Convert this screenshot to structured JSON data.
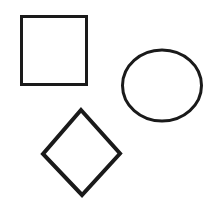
{
  "canvas": {
    "width": 211,
    "height": 200,
    "background_color": "#ffffff",
    "ink_color": "#1a1a1a",
    "description": "Three hand-drawn black outline geometric shapes on a plain white background: a square, an ellipse, and a diamond.",
    "shape_count": 3
  },
  "shapes": [
    {
      "name": "square",
      "label": "Square",
      "fill": "none",
      "stroke_color": "#1a1a1a",
      "stroke_width": 3,
      "position": "top-left",
      "points": "21.5,16.5 86.5,16.5 86.5,84.5 21.5,84.5",
      "bounds": {
        "x": 20,
        "y": 15,
        "width": 68,
        "height": 71
      }
    },
    {
      "name": "ellipse",
      "label": "Ellipse",
      "fill": "none",
      "stroke_color": "#1a1a1a",
      "stroke_width": 3,
      "position": "middle-right",
      "center_x": 162,
      "center_y": 85.5,
      "radius_x": 39.5,
      "radius_y": 35.5,
      "bounds": {
        "x": 121,
        "y": 49,
        "width": 82,
        "height": 73
      }
    },
    {
      "name": "diamond",
      "label": "Diamond",
      "fill": "none",
      "stroke_color": "#1a1a1a",
      "stroke_width": 4,
      "position": "bottom-left",
      "points": "81,110 120,153.5 82,195 43,154",
      "bounds": {
        "x": 41,
        "y": 108,
        "width": 81,
        "height": 89
      }
    }
  ]
}
